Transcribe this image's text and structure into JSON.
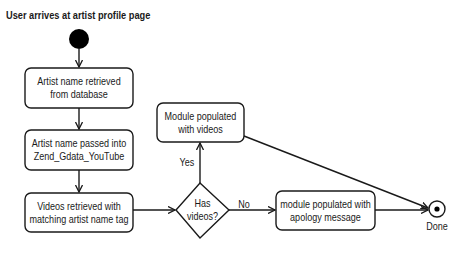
{
  "title": "User arrives at artist profile page",
  "nodes": {
    "start": {
      "type": "initial-node"
    },
    "artist_name_retrieved": {
      "label": "Artist name retrieved\nfrom database"
    },
    "artist_name_passed": {
      "label": "Artist name passed into\nZend_Gdata_YouTube"
    },
    "videos_retrieved": {
      "label": "Videos retrieved with\nmatching artist name tag"
    },
    "has_videos": {
      "label": "Has\nvideos?",
      "type": "decision"
    },
    "module_with_videos": {
      "label": "Module populated\nwith videos"
    },
    "module_apology": {
      "label": "module populated with\napology message"
    },
    "done": {
      "label": "Done",
      "type": "final-node"
    }
  },
  "edges": [
    {
      "from": "start",
      "to": "artist_name_retrieved",
      "label": ""
    },
    {
      "from": "artist_name_retrieved",
      "to": "artist_name_passed",
      "label": ""
    },
    {
      "from": "artist_name_passed",
      "to": "videos_retrieved",
      "label": ""
    },
    {
      "from": "videos_retrieved",
      "to": "has_videos",
      "label": ""
    },
    {
      "from": "has_videos",
      "to": "module_with_videos",
      "label": "Yes"
    },
    {
      "from": "has_videos",
      "to": "module_apology",
      "label": "No"
    },
    {
      "from": "module_with_videos",
      "to": "done",
      "label": ""
    },
    {
      "from": "module_apology",
      "to": "done",
      "label": ""
    }
  ],
  "colors": {
    "stroke": "#1a1a1a",
    "fill": "#ffffff"
  }
}
